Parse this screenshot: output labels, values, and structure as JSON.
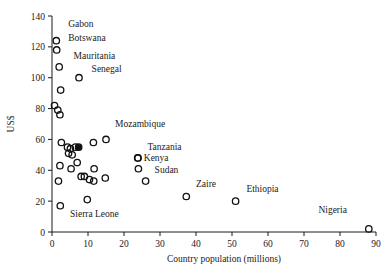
{
  "chart_data": {
    "type": "scatter",
    "title": "",
    "xlabel": "Country population (millions)",
    "ylabel": "US$",
    "xlim": [
      0,
      90
    ],
    "ylim": [
      0,
      140
    ],
    "xticks": [
      0,
      10,
      20,
      30,
      40,
      50,
      60,
      70,
      80,
      90
    ],
    "yticks": [
      0,
      20,
      40,
      60,
      80,
      100,
      120,
      140
    ],
    "grid": false,
    "legend": null,
    "marker_style": "open-circle",
    "points": [
      {
        "x": 1.2,
        "y": 124,
        "label": "Gabon",
        "label_pos": "above-right",
        "filled": false
      },
      {
        "x": 1.3,
        "y": 118,
        "label": "Botswana",
        "label_pos": "right",
        "filled": false
      },
      {
        "x": 2.0,
        "y": 107,
        "label": "Mauritania",
        "label_pos": "above-right",
        "filled": false
      },
      {
        "x": 7.5,
        "y": 100,
        "label": "Senegal",
        "label_pos": "above-right",
        "filled": false
      },
      {
        "x": 2.4,
        "y": 92,
        "label": "",
        "label_pos": "",
        "filled": false
      },
      {
        "x": 0.7,
        "y": 82,
        "label": "",
        "label_pos": "",
        "filled": false
      },
      {
        "x": 1.6,
        "y": 79,
        "label": "",
        "label_pos": "",
        "filled": false
      },
      {
        "x": 2.2,
        "y": 76,
        "label": "",
        "label_pos": "",
        "filled": false
      },
      {
        "x": 15.0,
        "y": 60,
        "label": "Mozambique",
        "label_pos": "above-right",
        "filled": false
      },
      {
        "x": 11.5,
        "y": 58,
        "label": "",
        "label_pos": "",
        "filled": false
      },
      {
        "x": 2.6,
        "y": 58,
        "label": "",
        "label_pos": "",
        "filled": false
      },
      {
        "x": 4.3,
        "y": 55,
        "label": "",
        "label_pos": "",
        "filled": false
      },
      {
        "x": 5.1,
        "y": 54,
        "label": "",
        "label_pos": "",
        "filled": false
      },
      {
        "x": 6.5,
        "y": 55,
        "label": "",
        "label_pos": "",
        "filled": false
      },
      {
        "x": 7.4,
        "y": 55,
        "label": "",
        "label_pos": "",
        "filled": true
      },
      {
        "x": 4.6,
        "y": 51,
        "label": "",
        "label_pos": "",
        "filled": false
      },
      {
        "x": 5.6,
        "y": 50,
        "label": "",
        "label_pos": "",
        "filled": false
      },
      {
        "x": 23.8,
        "y": 48,
        "label": "Tanzania",
        "label_pos": "above-right",
        "filled": false
      },
      {
        "x": 23.9,
        "y": 48,
        "label": "Kenya",
        "label_pos": "right",
        "filled": false
      },
      {
        "x": 2.2,
        "y": 43,
        "label": "",
        "label_pos": "",
        "filled": false
      },
      {
        "x": 7.0,
        "y": 45,
        "label": "",
        "label_pos": "",
        "filled": false
      },
      {
        "x": 11.7,
        "y": 41,
        "label": "",
        "label_pos": "",
        "filled": false
      },
      {
        "x": 5.3,
        "y": 41,
        "label": "",
        "label_pos": "",
        "filled": false
      },
      {
        "x": 24.0,
        "y": 41,
        "label": "",
        "label_pos": "",
        "filled": false
      },
      {
        "x": 8.1,
        "y": 36,
        "label": "",
        "label_pos": "",
        "filled": false
      },
      {
        "x": 9.0,
        "y": 36,
        "label": "",
        "label_pos": "",
        "filled": false
      },
      {
        "x": 10.4,
        "y": 34,
        "label": "",
        "label_pos": "",
        "filled": false
      },
      {
        "x": 11.6,
        "y": 33,
        "label": "",
        "label_pos": "",
        "filled": false
      },
      {
        "x": 14.8,
        "y": 35,
        "label": "",
        "label_pos": "",
        "filled": false
      },
      {
        "x": 26.0,
        "y": 33,
        "label": "Sudan",
        "label_pos": "above-right",
        "filled": false
      },
      {
        "x": 1.8,
        "y": 33,
        "label": "",
        "label_pos": "",
        "filled": false
      },
      {
        "x": 37.3,
        "y": 23,
        "label": "Zaire",
        "label_pos": "above-right",
        "filled": false
      },
      {
        "x": 9.8,
        "y": 21,
        "label": "",
        "label_pos": "",
        "filled": false
      },
      {
        "x": 51.0,
        "y": 20,
        "label": "Ethiopia",
        "label_pos": "above-right",
        "filled": false
      },
      {
        "x": 2.3,
        "y": 17,
        "label": "Sierra Leone",
        "label_pos": "below-right",
        "filled": false
      },
      {
        "x": 88.0,
        "y": 2,
        "label": "Nigeria",
        "label_pos": "above-left",
        "filled": false
      }
    ],
    "annotations": [
      {
        "text": "Gabon",
        "x": 4.5,
        "y": 133
      },
      {
        "text": "Botswana",
        "x": 4.5,
        "y": 124
      },
      {
        "text": "Mauritania",
        "x": 6.0,
        "y": 112
      },
      {
        "text": "Senegal",
        "x": 11.0,
        "y": 104
      },
      {
        "text": "Mozambique",
        "x": 17.5,
        "y": 68
      },
      {
        "text": "Tanzania",
        "x": 26.5,
        "y": 53
      },
      {
        "text": "Kenya",
        "x": 25.5,
        "y": 46
      },
      {
        "text": "Sudan",
        "x": 28.5,
        "y": 38
      },
      {
        "text": "Zaire",
        "x": 40.0,
        "y": 29
      },
      {
        "text": "Ethiopia",
        "x": 54.0,
        "y": 26
      },
      {
        "text": "Nigeria",
        "x": 74.0,
        "y": 12
      },
      {
        "text": "Sierra Leone",
        "x": 5.0,
        "y": 10
      }
    ],
    "colors": {
      "marker_stroke": "#111111",
      "marker_fill_highlight": "#111111",
      "axis": "#1a1a1a",
      "text": "#1a1a1a",
      "background": "#ffffff"
    }
  }
}
